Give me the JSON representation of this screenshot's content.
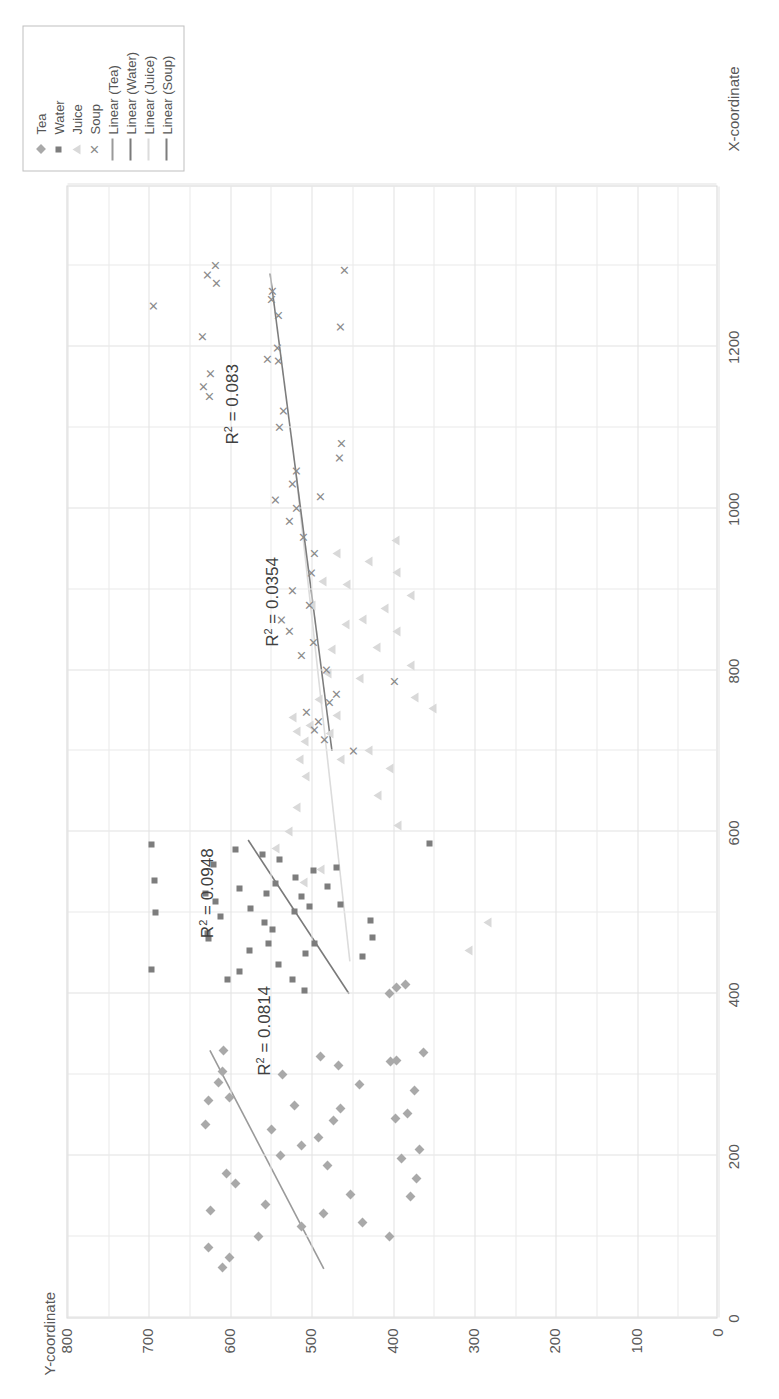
{
  "chart_data": {
    "type": "scatter",
    "title": "",
    "xlabel": "X-coordinate",
    "ylabel": "Y-coordinate",
    "xlim": [
      0,
      1400
    ],
    "ylim": [
      0,
      800
    ],
    "xticks": [
      0,
      200,
      400,
      600,
      800,
      1000,
      1200
    ],
    "yticks": [
      0,
      100,
      200,
      300,
      400,
      500,
      600,
      700,
      800
    ],
    "grid": true,
    "legend_position": "right-top",
    "legend_entries": [
      "Tea",
      "Water",
      "Juice",
      "Soup",
      "Linear (Tea)",
      "Linear (Water)",
      "Linear (Juice)",
      "Linear (Soup)"
    ],
    "annotations": [
      {
        "text": "R² = 0.0814",
        "series": "Tea",
        "value": 0.0814
      },
      {
        "text": "R² = 0.0948",
        "series": "Water",
        "value": 0.0948
      },
      {
        "text": "R² = 0.0354",
        "series": "Juice",
        "value": 0.0354
      },
      {
        "text": "R² = 0.083",
        "series": "Soup",
        "value": 0.083
      }
    ],
    "series": [
      {
        "name": "Tea",
        "marker": "diamond",
        "color": "#a9a9a9",
        "trend_color": "#9a9a9a",
        "trend_x": [
          60,
          330
        ],
        "trend_y": [
          485,
          625
        ],
        "points": [
          [
            62,
            609
          ],
          [
            74,
            601
          ],
          [
            86,
            627
          ],
          [
            100,
            565
          ],
          [
            112,
            512
          ],
          [
            128,
            486
          ],
          [
            140,
            557
          ],
          [
            152,
            452
          ],
          [
            166,
            594
          ],
          [
            178,
            604
          ],
          [
            188,
            481
          ],
          [
            200,
            538
          ],
          [
            212,
            512
          ],
          [
            222,
            492
          ],
          [
            232,
            549
          ],
          [
            244,
            473
          ],
          [
            252,
            382
          ],
          [
            262,
            521
          ],
          [
            272,
            601
          ],
          [
            280,
            374
          ],
          [
            290,
            614
          ],
          [
            300,
            536
          ],
          [
            312,
            467
          ],
          [
            322,
            489
          ],
          [
            330,
            608
          ],
          [
            150,
            378
          ],
          [
            172,
            371
          ],
          [
            196,
            389
          ],
          [
            208,
            367
          ],
          [
            246,
            397
          ],
          [
            268,
            627
          ],
          [
            288,
            441
          ],
          [
            304,
            610
          ],
          [
            316,
            403
          ],
          [
            328,
            363
          ],
          [
            100,
            404
          ],
          [
            118,
            438
          ],
          [
            132,
            624
          ],
          [
            238,
            631
          ],
          [
            258,
            464
          ],
          [
            400,
            404
          ],
          [
            408,
            396
          ],
          [
            412,
            385
          ],
          [
            318,
            396
          ]
        ]
      },
      {
        "name": "Water",
        "marker": "square",
        "color": "#7d7d7d",
        "trend_color": "#7a7a7a",
        "trend_x": [
          400,
          590
        ],
        "trend_y": [
          454,
          578
        ],
        "points": [
          [
            404,
            509
          ],
          [
            418,
            603
          ],
          [
            428,
            589
          ],
          [
            436,
            541
          ],
          [
            446,
            437
          ],
          [
            454,
            576
          ],
          [
            462,
            496
          ],
          [
            468,
            627
          ],
          [
            474,
            628
          ],
          [
            480,
            548
          ],
          [
            488,
            558
          ],
          [
            496,
            612
          ],
          [
            502,
            521
          ],
          [
            508,
            502
          ],
          [
            514,
            618
          ],
          [
            520,
            512
          ],
          [
            524,
            631
          ],
          [
            530,
            589
          ],
          [
            536,
            545
          ],
          [
            544,
            520
          ],
          [
            552,
            498
          ],
          [
            560,
            621
          ],
          [
            566,
            540
          ],
          [
            572,
            560
          ],
          [
            578,
            593
          ],
          [
            584,
            697
          ],
          [
            430,
            697
          ],
          [
            500,
            692
          ],
          [
            540,
            693
          ],
          [
            470,
            425
          ],
          [
            490,
            428
          ],
          [
            510,
            465
          ],
          [
            556,
            469
          ],
          [
            586,
            355
          ],
          [
            450,
            508
          ],
          [
            418,
            523
          ],
          [
            506,
            575
          ],
          [
            524,
            556
          ],
          [
            532,
            481
          ],
          [
            462,
            553
          ]
        ]
      },
      {
        "name": "Juice",
        "marker": "triangle",
        "color": "#d9d9d9",
        "trend_color": "#dcdcdc",
        "trend_x": [
          440,
          1050
        ],
        "trend_y": [
          453,
          520
        ],
        "points": [
          [
            453,
            307
          ],
          [
            488,
            284
          ],
          [
            538,
            510
          ],
          [
            554,
            489
          ],
          [
            608,
            394
          ],
          [
            645,
            419
          ],
          [
            678,
            404
          ],
          [
            690,
            465
          ],
          [
            700,
            430
          ],
          [
            712,
            509
          ],
          [
            722,
            478
          ],
          [
            732,
            502
          ],
          [
            744,
            469
          ],
          [
            752,
            352
          ],
          [
            766,
            374
          ],
          [
            790,
            441
          ],
          [
            806,
            378
          ],
          [
            828,
            420
          ],
          [
            848,
            396
          ],
          [
            862,
            438
          ],
          [
            876,
            410
          ],
          [
            892,
            378
          ],
          [
            906,
            457
          ],
          [
            920,
            396
          ],
          [
            934,
            430
          ],
          [
            944,
            470
          ],
          [
            960,
            397
          ],
          [
            724,
            518
          ],
          [
            742,
            523
          ],
          [
            764,
            491
          ],
          [
            796,
            480
          ],
          [
            826,
            476
          ],
          [
            856,
            458
          ],
          [
            880,
            500
          ],
          [
            910,
            487
          ],
          [
            690,
            515
          ],
          [
            668,
            508
          ],
          [
            630,
            518
          ],
          [
            600,
            529
          ],
          [
            580,
            544
          ]
        ]
      },
      {
        "name": "Soup",
        "marker": "x",
        "color": "#8a8a8a",
        "trend_color": "#7d7d7d",
        "trend_x": [
          700,
          1290
        ],
        "trend_y": [
          475,
          551
        ],
        "points": [
          [
            700,
            448
          ],
          [
            714,
            484
          ],
          [
            726,
            497
          ],
          [
            736,
            492
          ],
          [
            748,
            506
          ],
          [
            760,
            478
          ],
          [
            770,
            470
          ],
          [
            786,
            398
          ],
          [
            800,
            482
          ],
          [
            818,
            512
          ],
          [
            834,
            498
          ],
          [
            848,
            527
          ],
          [
            862,
            537
          ],
          [
            880,
            502
          ],
          [
            898,
            523
          ],
          [
            920,
            500
          ],
          [
            944,
            496
          ],
          [
            964,
            510
          ],
          [
            984,
            527
          ],
          [
            1000,
            519
          ],
          [
            1010,
            544
          ],
          [
            1030,
            524
          ],
          [
            1046,
            519
          ],
          [
            1062,
            466
          ],
          [
            1080,
            463
          ],
          [
            1100,
            539
          ],
          [
            1120,
            535
          ],
          [
            1138,
            625
          ],
          [
            1150,
            633
          ],
          [
            1166,
            624
          ],
          [
            1184,
            554
          ],
          [
            1198,
            542
          ],
          [
            1212,
            634
          ],
          [
            1224,
            464
          ],
          [
            1238,
            541
          ],
          [
            1250,
            694
          ],
          [
            1258,
            549
          ],
          [
            1268,
            548
          ],
          [
            1278,
            617
          ],
          [
            1288,
            628
          ],
          [
            1294,
            459
          ],
          [
            1300,
            618
          ],
          [
            1182,
            541
          ],
          [
            1014,
            489
          ]
        ]
      }
    ]
  }
}
